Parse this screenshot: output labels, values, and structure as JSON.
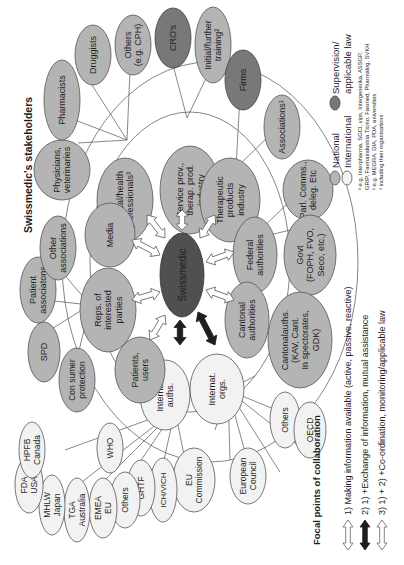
{
  "title": "Swissmedic's stakeholders",
  "center": {
    "label": "Swissmedic"
  },
  "nodes": {
    "medical_health": [
      "Medical/health",
      "professionals³"
    ],
    "service_prov": [
      "Service prov.,",
      "therap. prod.",
      "industry"
    ],
    "therapeutic": [
      "Therapeutic",
      "products",
      "industry"
    ],
    "federal": [
      "Federal",
      "authorities"
    ],
    "cantonal": [
      "Cantonal",
      "authorities"
    ],
    "internat_orgs": [
      "Internat.",
      "orgs."
    ],
    "internat_auths": [
      "Internat.",
      "auths."
    ],
    "patients": [
      "Patients,",
      "users"
    ],
    "reps": [
      "Reps. of",
      "interested",
      "parties"
    ],
    "media": [
      "Media"
    ],
    "physicians": [
      "Physicians,",
      "veterinaries"
    ],
    "pharmacists": [
      "Pharmacists"
    ],
    "druggists": [
      "Druggists"
    ],
    "others_cph": [
      "Others",
      "(e.g. CPH)"
    ],
    "cros": [
      "CRO's"
    ],
    "training": [
      "Initial/further",
      "training²"
    ],
    "firms": [
      "Firms"
    ],
    "associations": [
      "Associations¹"
    ],
    "parl": [
      "Parl. Comms.,",
      "deleg. Etc"
    ],
    "govt": [
      "Govt",
      "(FOPH, FVO,",
      "Seco, etc.)"
    ],
    "cantonal_auths": [
      "Cantonalauths.",
      "(KAV, Cant.",
      "In spectorates,",
      "GDK)"
    ],
    "others_orgs": [
      "Others"
    ],
    "oecd": [
      "OECD"
    ],
    "european_council": [
      "European",
      "Council"
    ],
    "eu_commission": [
      "EU",
      "Commission"
    ],
    "ich": [
      "ICH/VICH"
    ],
    "ghtf": [
      "GHTF"
    ],
    "who": [
      "WHO"
    ],
    "others_auths": [
      "Others"
    ],
    "emea": [
      "EMEA",
      "EU"
    ],
    "tga": [
      "TGA",
      "Australia"
    ],
    "mhlw": [
      "MHLW",
      "Japan"
    ],
    "fda": [
      "FDA",
      "USA"
    ],
    "hpfb": [
      "HPFB",
      "Canada"
    ],
    "consumer": [
      "Con sumer",
      "protection"
    ],
    "spd": [
      "SPD"
    ],
    "patient_assoc": [
      "Patient",
      "associatons"
    ],
    "other_assoc": [
      "Other",
      "associations"
    ]
  },
  "legend": {
    "national": "National",
    "international": "International",
    "supervision": [
      "Supervision/",
      "applicable law"
    ],
    "footnotes": [
      "¹ e.g. Interpharma, SGCI, vips, Intergenerika, ASSGP,",
      "GRIP, Farmaindustria Ticino, Fasmed, Pharmalog, SVKH",
      "² e.g. MEGRA, DIA, PDA, universities",
      "³ including their organisations"
    ]
  },
  "collaboration": {
    "title": "Focal points of collaboration",
    "items": [
      "1) Making information available (active, passive, reactive)",
      "2) 1) +Exchange of information, mutual assistance",
      "3) 1) + 2) +Co-ordination, monitoring/applicable law"
    ]
  },
  "colors": {
    "national": "#b4b4b4",
    "international": "#f2f2f2",
    "supervision": "#787878",
    "hub": "#505050"
  }
}
